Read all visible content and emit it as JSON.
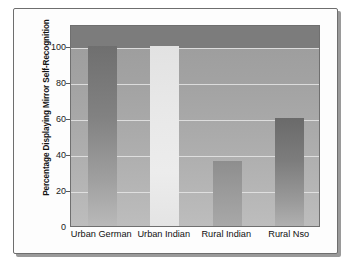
{
  "figure": {
    "kind": "bar-chart-figure",
    "background_color": "#ffffff",
    "frame_border_color": "#6e6e6e"
  },
  "chart_data": {
    "type": "bar",
    "title": "",
    "xlabel": "",
    "ylabel": "Percentage Displaying Mirror Self-Recognition",
    "categories": [
      "Urban German",
      "Urban Indian",
      "Rural Indian",
      "Rural Nso"
    ],
    "values": [
      100,
      100,
      36,
      60
    ],
    "ylim": [
      0,
      112
    ],
    "yticks": [
      0,
      20,
      40,
      60,
      80,
      100
    ],
    "ytick_labels": [
      "0",
      "20",
      "40",
      "60",
      "80",
      "100"
    ],
    "grid": true,
    "grid_color": "#e6e6e6",
    "legend": null,
    "legend_position": "none",
    "bar_colors": [
      "#828282",
      "#eaeaea",
      "#9a9a9a",
      "#7d7d7d"
    ],
    "plot_background": "#a8a8a8",
    "series": [
      {
        "name": "Percentage Displaying Mirror Self-Recognition",
        "values": [
          100,
          100,
          36,
          60
        ]
      }
    ]
  }
}
